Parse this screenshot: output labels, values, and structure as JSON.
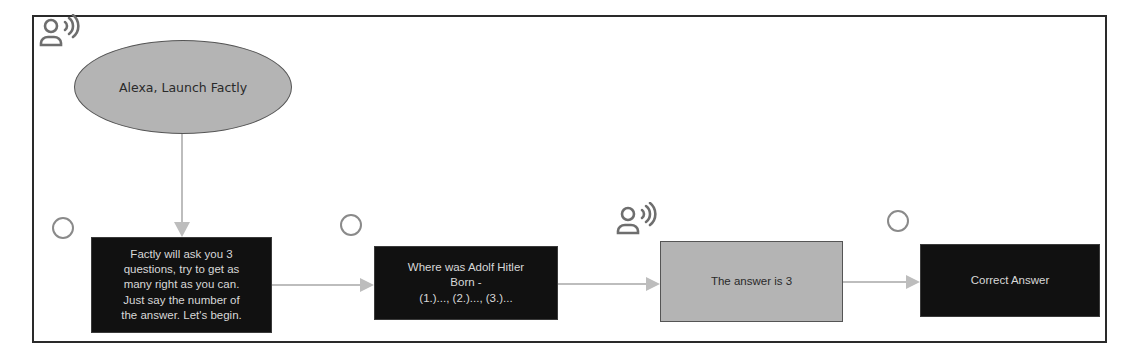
{
  "diagram": {
    "colors": {
      "frame": "#2a2a2a",
      "dark_node": "#111111",
      "dark_node_text": "#d8d8d8",
      "gray_node": "#b4b4b4",
      "gray_node_text": "#2a2a2a",
      "connector": "#bdbdbd",
      "icon": "#6e6e6e"
    },
    "nodes": [
      {
        "id": "launch",
        "shape": "ellipse",
        "speaker": "user",
        "speaker_icon": "user-voice-icon",
        "lines": [
          "Alexa, Launch Factly"
        ]
      },
      {
        "id": "intro",
        "shape": "rectangle",
        "speaker": "alexa",
        "speaker_icon": "circle-icon",
        "lines": [
          "Factly will ask you 3",
          "questions, try to get as",
          "many right as you can.",
          "Just say the number of",
          "the answer. Let's begin."
        ]
      },
      {
        "id": "question",
        "shape": "rectangle",
        "speaker": "alexa",
        "speaker_icon": "circle-icon",
        "lines": [
          "Where was Adolf Hitler",
          "Born -",
          "(1.)..., (2.)..., (3.)..."
        ]
      },
      {
        "id": "user-answer",
        "shape": "rectangle",
        "speaker": "user",
        "speaker_icon": "user-voice-icon",
        "lines": [
          "The answer is 3"
        ]
      },
      {
        "id": "feedback",
        "shape": "rectangle",
        "speaker": "alexa",
        "speaker_icon": "circle-icon",
        "lines": [
          "Correct Answer"
        ]
      }
    ],
    "edges": [
      {
        "from": "launch",
        "to": "intro",
        "direction": "down"
      },
      {
        "from": "intro",
        "to": "question",
        "direction": "right"
      },
      {
        "from": "question",
        "to": "user-answer",
        "direction": "right"
      },
      {
        "from": "user-answer",
        "to": "feedback",
        "direction": "right"
      }
    ]
  }
}
